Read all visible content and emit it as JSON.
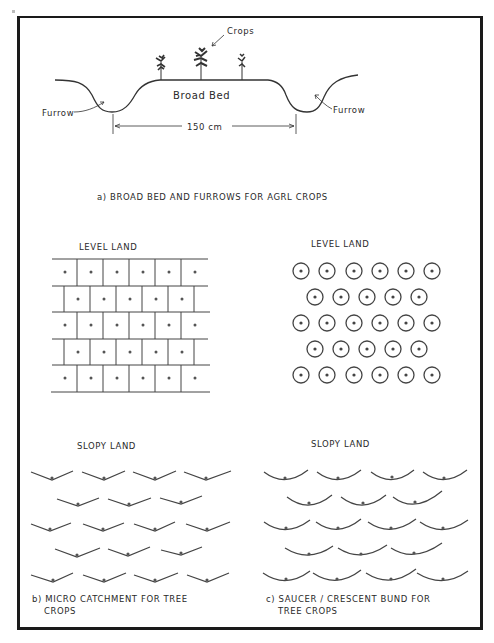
{
  "figure": {
    "panel_a": {
      "labels": {
        "crops": "Crops",
        "broad_bed": "Broad Bed",
        "furrow_left": "Furrow",
        "furrow_right": "Furrow",
        "width": "150 cm"
      },
      "caption": "a)  BROAD BED  AND  FURROWS  FOR  AGRL  CROPS"
    },
    "panel_b": {
      "level_title": "LEVEL LAND",
      "slopy_title": "SLOPY LAND",
      "caption_line1": "b)  MICRO  CATCHMENT  FOR  TREE",
      "caption_line2": "CROPS",
      "level_rows": [
        6,
        6,
        6,
        6,
        6
      ],
      "slopy_rows": [
        4,
        3,
        4,
        3,
        4
      ]
    },
    "panel_c": {
      "level_title": "LEVEL LAND",
      "slopy_title": "SLOPY LAND",
      "caption_line1": "c)  SAUCER / CRESCENT  BUND  FOR",
      "caption_line2": "TREE  CROPS",
      "level_rows": [
        6,
        5,
        6,
        5,
        6
      ],
      "slopy_rows": [
        4,
        3,
        4,
        3,
        4
      ]
    },
    "colors": {
      "ink": "#2a2a2a",
      "paper": "#ffffff",
      "frame": "#1a1a1a"
    }
  }
}
